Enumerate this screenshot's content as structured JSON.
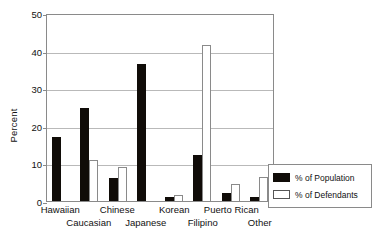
{
  "chart_data": {
    "type": "bar",
    "title": "",
    "xlabel": "",
    "ylabel": "Percent",
    "ylim": [
      0,
      50
    ],
    "yticks": [
      0,
      10,
      20,
      30,
      40,
      50
    ],
    "grid": true,
    "legend_position": "bottom-right",
    "categories": [
      "Hawaiian",
      "Caucasian",
      "Chinese",
      "Japanese",
      "Korean",
      "Filipino",
      "Puerto Rican",
      "Other"
    ],
    "series": [
      {
        "name": "% of Population",
        "color": "#100c08",
        "values": [
          17.0,
          24.7,
          6.0,
          36.5,
          1.0,
          12.3,
          2.0,
          1.0
        ]
      },
      {
        "name": "% of Defendants",
        "color": "#ffffff",
        "values": [
          0,
          11.0,
          9.0,
          0,
          1.5,
          41.5,
          4.5,
          6.5
        ]
      }
    ]
  },
  "axis": {
    "y_title": "Percent",
    "tick_labels": [
      "50",
      "40",
      "30",
      "20",
      "10",
      "0"
    ]
  },
  "x_axis_labels": [
    {
      "text": "Hawaiian",
      "row": 0
    },
    {
      "text": "Caucasian",
      "row": 1
    },
    {
      "text": "Chinese",
      "row": 0
    },
    {
      "text": "Japanese",
      "row": 1
    },
    {
      "text": "Korean",
      "row": 0
    },
    {
      "text": "Filipino",
      "row": 1
    },
    {
      "text": "Puerto Rican",
      "row": 0
    },
    {
      "text": "Other",
      "row": 1
    }
  ],
  "legend": {
    "items": [
      {
        "label": "% of Population",
        "style": "pop"
      },
      {
        "label": "% of Defendants",
        "style": "def"
      }
    ]
  }
}
